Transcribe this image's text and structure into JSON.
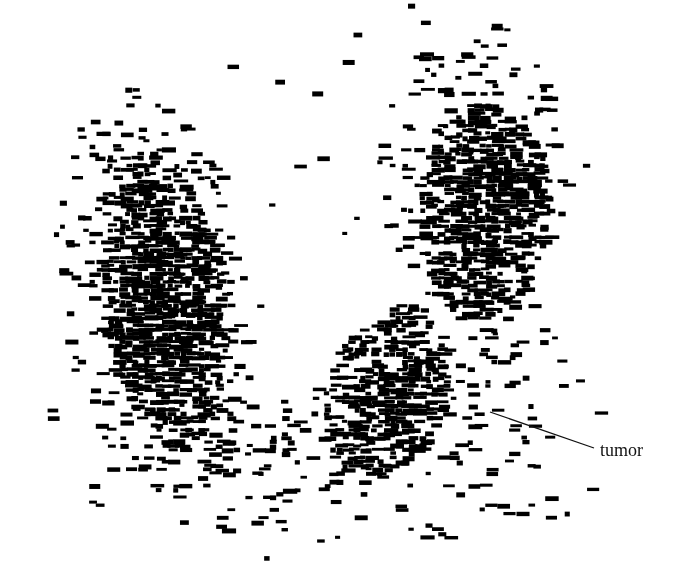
{
  "image": {
    "description": "Monochrome planar scintigraphy scan showing two dense uptake lobes forming a V shape, with a region of low uptake labeled as tumor",
    "width": 684,
    "height": 580,
    "background_color": "#ffffff",
    "ink_color": "#000000"
  },
  "annotation": {
    "label": "tumor",
    "label_x": 600,
    "label_y": 441,
    "label_color": "#111111",
    "leader": {
      "x1": 490,
      "y1": 412,
      "x2": 594,
      "y2": 448,
      "color": "#111111",
      "width": 1.3
    }
  },
  "uptake_regions": [
    {
      "name": "left-lobe-core",
      "cx": 160,
      "cy": 300,
      "rx": 62,
      "ry": 150,
      "density": 0.62,
      "tilt": -0.12
    },
    {
      "name": "left-lobe-halo",
      "cx": 150,
      "cy": 290,
      "rx": 95,
      "ry": 210,
      "density": 0.16,
      "tilt": -0.12
    },
    {
      "name": "right-upper-core",
      "cx": 480,
      "cy": 210,
      "rx": 65,
      "ry": 110,
      "density": 0.6,
      "tilt": 0.05
    },
    {
      "name": "right-upper-halo",
      "cx": 470,
      "cy": 170,
      "rx": 95,
      "ry": 150,
      "density": 0.15,
      "tilt": 0.05
    },
    {
      "name": "center-lower-core",
      "cx": 385,
      "cy": 390,
      "rx": 60,
      "ry": 90,
      "density": 0.55,
      "tilt": 0.3
    },
    {
      "name": "bridge",
      "cx": 300,
      "cy": 440,
      "rx": 110,
      "ry": 55,
      "density": 0.16,
      "tilt": 0
    },
    {
      "name": "right-lower-halo",
      "cx": 470,
      "cy": 380,
      "rx": 90,
      "ry": 110,
      "density": 0.08,
      "tilt": 0
    },
    {
      "name": "bottom-scatter",
      "cx": 330,
      "cy": 490,
      "rx": 260,
      "ry": 60,
      "density": 0.035,
      "tilt": 0
    },
    {
      "name": "global-scatter",
      "cx": 342,
      "cy": 280,
      "rx": 340,
      "ry": 290,
      "density": 0.006,
      "tilt": 0
    }
  ],
  "render": {
    "grain_x": 6,
    "grain_y": 4,
    "seed": 20240611
  }
}
